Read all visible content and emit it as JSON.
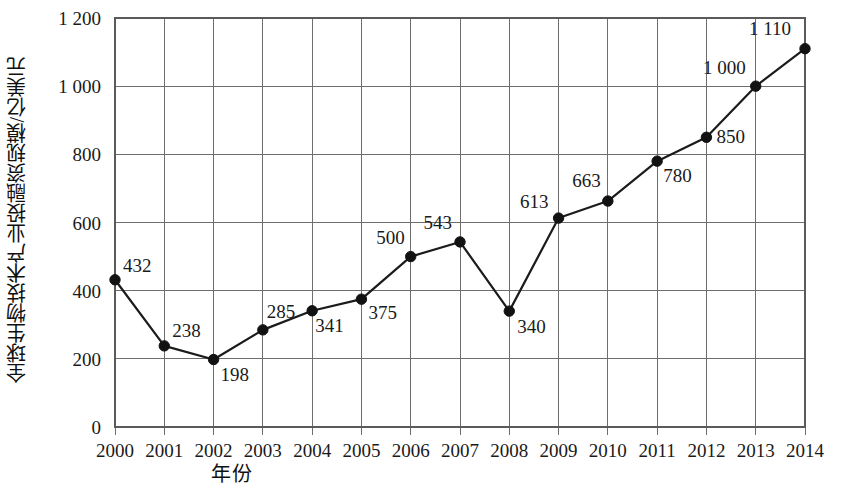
{
  "chart_data": {
    "type": "line",
    "title": "",
    "subtitle": "",
    "xlabel": "年份",
    "ylabel": "全球生物技术产业投融资规模/亿美元",
    "categories": [
      "2000",
      "2001",
      "2002",
      "2003",
      "2004",
      "2005",
      "2006",
      "2007",
      "2008",
      "2009",
      "2010",
      "2011",
      "2012",
      "2013",
      "2014"
    ],
    "values": [
      432,
      238,
      198,
      285,
      341,
      375,
      500,
      543,
      340,
      613,
      663,
      780,
      850,
      1000,
      1110
    ],
    "point_labels": [
      "432",
      "238",
      "198",
      "285",
      "341",
      "375",
      "500",
      "543",
      "340",
      "613",
      "663",
      "780",
      "850",
      "1 000",
      "1 110"
    ],
    "series": [
      {
        "name": "全球生物技术产业投融资规模",
        "values": [
          432,
          238,
          198,
          285,
          341,
          375,
          500,
          543,
          340,
          613,
          663,
          780,
          850,
          1000,
          1110
        ]
      }
    ],
    "ylim": [
      0,
      1200
    ],
    "ytick_values": [
      0,
      200,
      400,
      600,
      800,
      1000,
      1200
    ],
    "ytick_labels": [
      "0",
      "200",
      "400",
      "600",
      "800",
      "1 000",
      "1 200"
    ],
    "xtick_labels": [
      "2000",
      "2001",
      "2002",
      "2003",
      "2004",
      "2005",
      "2006",
      "2007",
      "2008",
      "2009",
      "2010",
      "2011",
      "2012",
      "2013",
      "2014"
    ],
    "grid": true,
    "grid_axes": "both",
    "legend": false,
    "legend_position": "none",
    "marker": "filled-circle",
    "line_color": "#1b1b1b",
    "marker_color": "#121212",
    "grid_color": "#6e6e6e",
    "background_color": "#ffffff",
    "label_offsets": [
      {
        "dx": 8,
        "dy": -8
      },
      {
        "dx": 8,
        "dy": -9
      },
      {
        "dx": 7,
        "dy": 21
      },
      {
        "dx": 4,
        "dy": -12
      },
      {
        "dx": 3,
        "dy": 21
      },
      {
        "dx": 7,
        "dy": 20
      },
      {
        "dx": -6,
        "dy": -13
      },
      {
        "dx": -8,
        "dy": -13
      },
      {
        "dx": 8,
        "dy": 22
      },
      {
        "dx": -10,
        "dy": -10
      },
      {
        "dx": -7,
        "dy": -14
      },
      {
        "dx": 6,
        "dy": 21
      },
      {
        "dx": 10,
        "dy": 6
      },
      {
        "dx": -10,
        "dy": -12
      },
      {
        "dx": -14,
        "dy": -14
      }
    ]
  },
  "axes": {
    "x_title": "年份",
    "y_title": "全球生物技术产业投融资规模/亿美元"
  }
}
